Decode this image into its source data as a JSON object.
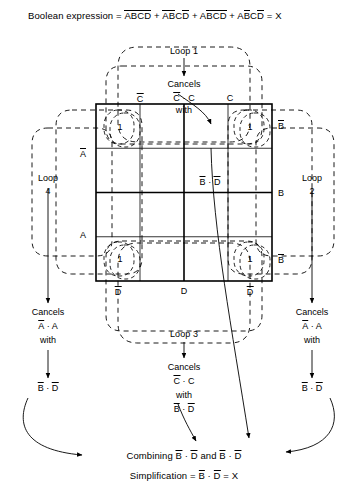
{
  "title": {
    "prefix": "Boolean expression =",
    "terms": [
      {
        "vars": [
          {
            "t": "A",
            "bar": true
          },
          {
            "t": "B",
            "bar": true
          },
          {
            "t": "C",
            "bar": true
          },
          {
            "t": "D",
            "bar": true
          }
        ]
      },
      {
        "vars": [
          {
            "t": "A",
            "bar": true
          },
          {
            "t": "B",
            "bar": true
          },
          {
            "t": "C",
            "bar": false
          },
          {
            "t": "D",
            "bar": true
          }
        ]
      },
      {
        "vars": [
          {
            "t": "A",
            "bar": false
          },
          {
            "t": "B",
            "bar": true
          },
          {
            "t": "C",
            "bar": true
          },
          {
            "t": "D",
            "bar": true
          }
        ]
      },
      {
        "vars": [
          {
            "t": "A",
            "bar": false
          },
          {
            "t": "B",
            "bar": true
          },
          {
            "t": "C",
            "bar": false
          },
          {
            "t": "D",
            "bar": true
          }
        ]
      }
    ],
    "plus": "+",
    "equals": "=",
    "result": "X"
  },
  "kmap": {
    "cells_with_one": [
      "1",
      "1",
      "1",
      "1"
    ],
    "col_labels_top": [
      {
        "text": "C",
        "bar": true
      },
      {
        "text": "C",
        "bar": false
      }
    ],
    "col_labels_bottom": [
      {
        "text": "D",
        "bar": true
      },
      {
        "text": "D",
        "bar": false
      },
      {
        "text": "D",
        "bar": true
      }
    ],
    "row_labels_left": [
      {
        "text": "A",
        "bar": true
      },
      {
        "text": "A",
        "bar": false
      }
    ],
    "row_labels_right": [
      {
        "text": "B",
        "bar": true
      },
      {
        "text": "B",
        "bar": false
      },
      {
        "text": "B",
        "bar": true
      }
    ],
    "center_annotation": {
      "b": "B",
      "dot": "·",
      "d": "D"
    }
  },
  "loops": {
    "loop1": {
      "name": "Loop 1",
      "cancels_word": "Cancels",
      "cancel_pair": {
        "left": "C",
        "left_bar": true,
        "dot": "·",
        "right": "C",
        "right_bar": false
      },
      "with_word": "with"
    },
    "loop2": {
      "name_line1": "Loop",
      "name_line2": "2",
      "cancels_word": "Cancels",
      "cancel_pair": {
        "left": "A",
        "left_bar": true,
        "dot": "·",
        "right": "A",
        "right_bar": false
      },
      "with_word": "with",
      "result": {
        "b": "B",
        "dot": "·",
        "d": "D"
      }
    },
    "loop3": {
      "name": "Loop 3",
      "cancels_word": "Cancels",
      "cancel_pair": {
        "left": "C",
        "left_bar": true,
        "dot": "·",
        "right": "C",
        "right_bar": false
      },
      "with_word": "with",
      "result": {
        "b": "B",
        "dot": "·",
        "d": "D"
      }
    },
    "loop4": {
      "name_line1": "Loop",
      "name_line2": "4",
      "cancels_word": "Cancels",
      "cancel_pair": {
        "left": "A",
        "left_bar": true,
        "dot": "·",
        "right": "A",
        "right_bar": false
      },
      "with_word": "with",
      "result": {
        "b": "B",
        "dot": "·",
        "d": "D"
      }
    }
  },
  "conclusion": {
    "combining_word": "Combining",
    "term1": {
      "b": "B",
      "dot": "·",
      "d": "D"
    },
    "and_word": "and",
    "term2": {
      "b": "B",
      "dot": "·",
      "d": "D"
    },
    "simplification_word": "Simplification =",
    "final": {
      "b": "B",
      "dot": "·",
      "d": "D"
    },
    "equals": "=",
    "result": "X"
  },
  "colors": {
    "ink": "#000000",
    "paper": "#ffffff"
  }
}
